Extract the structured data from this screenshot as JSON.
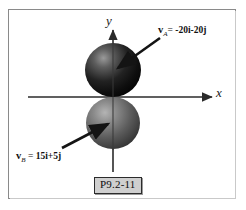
{
  "figure": {
    "caption": "P9.2-11",
    "background_color": "#ffffff",
    "frame_color": "#8a8a8a"
  },
  "axes": {
    "x_label": "x",
    "y_label": "y",
    "axis_color": "#2b2b2b"
  },
  "vectors": [
    {
      "id": "vector-a",
      "symbol": "v",
      "subscript": "A",
      "equals": "=",
      "expression": "-20i-20j",
      "i_coefficient": -20,
      "j_coefficient": -20,
      "label_full": "v_A = -20i-20j",
      "arrow_color": "#1a1a1a"
    },
    {
      "id": "vector-b",
      "symbol": "v",
      "subscript": "B",
      "equals": "=",
      "expression": "15i+5j",
      "i_coefficient": 15,
      "j_coefficient": 5,
      "label_full": "v_B = 15i+5j",
      "arrow_color": "#1a1a1a"
    }
  ],
  "bodies": [
    {
      "id": "sphere-a",
      "name": "A",
      "position": "above-origin",
      "fill_dark": "#151515",
      "fill_light": "#8e8e8e"
    },
    {
      "id": "sphere-b",
      "name": "B",
      "position": "below-origin",
      "fill_dark": "#3a3a3a",
      "fill_light": "#a8a8a8"
    }
  ],
  "vector_label_parts": {
    "a_prefix": "=",
    "b_prefix": "="
  }
}
